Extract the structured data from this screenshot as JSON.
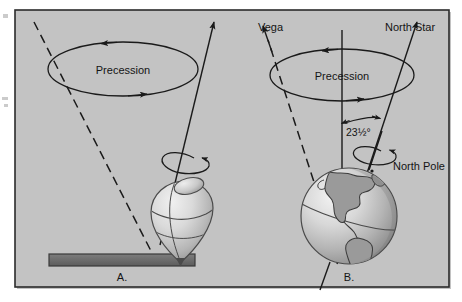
{
  "figure": {
    "title_alt": "Precession of a spinning top compared with precession of Earth's rotational axis",
    "background_color": "#ffffff",
    "panel_fill": "#c3c3c3",
    "panel_border_color": "#2b2b2b",
    "line_color": "#1a1a1a",
    "base_bar_color": "#6e6e6e",
    "globe_light": "#e8e8e8",
    "globe_mid": "#bdbdbd",
    "globe_dark": "#8e8e8e"
  },
  "panel_a": {
    "letter": "A.",
    "precession_label": "Precession",
    "icons": {
      "precession_ellipse": "precession-orbit-ellipse",
      "precession_arrow_left": "arrow-left",
      "precession_arrow_right": "arrow-right",
      "spin_ellipse": "spin-arrow-ellipse",
      "top_body": "spinning-top",
      "base_bar": "table-surface-bar",
      "dashed_axis": "dashed-reference-axis",
      "tilt_axis": "tilted-spin-axis"
    }
  },
  "panel_b": {
    "letter": "B.",
    "precession_label": "Precession",
    "vega_label": "Vega",
    "north_star_label": "North Star",
    "north_pole_label": "North Pole",
    "tilt_angle_label": "23½°",
    "icons": {
      "precession_ellipse": "precession-orbit-ellipse",
      "precession_arrow_left": "arrow-left",
      "precession_arrow_right": "arrow-right",
      "vertical_axis": "vertical-reference-axis",
      "dashed_axis": "dashed-vega-axis",
      "tilt_axis": "tilted-earth-axis",
      "angle_arc": "tilt-angle-arc",
      "spin_ellipse": "earth-spin-arrow-ellipse",
      "globe": "earth-globe"
    }
  }
}
